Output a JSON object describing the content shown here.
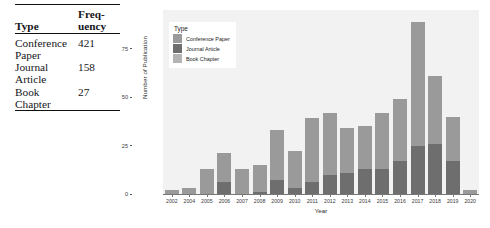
{
  "table": {
    "headers": [
      "Type",
      "Freq-",
      "uency"
    ],
    "header_type": "Type",
    "header_freq_line1": "Freq-",
    "header_freq_line2": "uency",
    "rows": [
      {
        "type_line1": "Conference",
        "type_line2": "Paper",
        "frequency": "421"
      },
      {
        "type_line1": "Journal",
        "type_line2": "Article",
        "frequency": "158"
      },
      {
        "type_line1": "Book",
        "type_line2": "Chapter",
        "frequency": "27"
      }
    ]
  },
  "legend": {
    "title": "Type",
    "items": [
      {
        "label": "Conference Paper",
        "color": "#9a9a9a"
      },
      {
        "label": "Journal Article",
        "color": "#6e6e6e"
      },
      {
        "label": "Book Chapter",
        "color": "#b4b4b4"
      }
    ]
  },
  "chart_data": {
    "type": "bar",
    "title": "",
    "xlabel": "Year",
    "ylabel": "Number of Publication",
    "ylim": [
      0,
      95
    ],
    "yticks": [
      0,
      25,
      50,
      75
    ],
    "ytick_labels": [
      "0",
      "25",
      "50",
      "75"
    ],
    "grid": false,
    "legend_position": "top-left inside",
    "stacked": true,
    "categories": [
      "2002",
      "2004",
      "2005",
      "2006",
      "2007",
      "2008",
      "2009",
      "2010",
      "2011",
      "2012",
      "2013",
      "2014",
      "2015",
      "2016",
      "2017",
      "2018",
      "2019",
      "2020"
    ],
    "series": [
      {
        "name": "Conference Paper",
        "color": "#9a9a9a",
        "values": [
          2,
          3,
          13,
          15,
          13,
          14,
          26,
          19,
          33,
          32,
          23,
          22,
          29,
          32,
          64,
          35,
          23,
          2
        ]
      },
      {
        "name": "Journal Article",
        "color": "#6e6e6e",
        "values": [
          0,
          0,
          0,
          6,
          0,
          1,
          7,
          3,
          6,
          10,
          11,
          13,
          13,
          17,
          25,
          26,
          17,
          0
        ]
      },
      {
        "name": "Book Chapter",
        "color": "#b4b4b4",
        "values": [
          0,
          0,
          0,
          0,
          0,
          0,
          0,
          0,
          0,
          0,
          0,
          0,
          0,
          0,
          0,
          0,
          0,
          0
        ]
      }
    ],
    "totals": [
      2,
      3,
      13,
      21,
      13,
      15,
      33,
      22,
      39,
      42,
      34,
      35,
      42,
      49,
      89,
      61,
      40,
      2
    ]
  }
}
